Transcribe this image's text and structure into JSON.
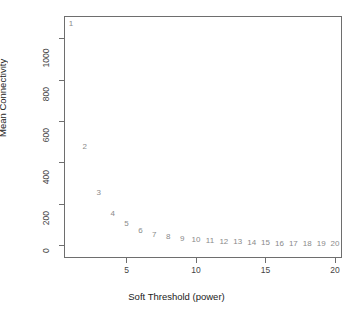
{
  "chart_data": {
    "type": "scatter",
    "title": "",
    "xlabel": "Soft Threshold (power)",
    "ylabel": "Mean Connectivity",
    "xlim": [
      0.5,
      20.5
    ],
    "ylim": [
      -60,
      1110
    ],
    "grid": false,
    "legend": null,
    "point_marker_style": "numeric-text-label",
    "x": [
      1,
      2,
      3,
      4,
      5,
      6,
      7,
      8,
      9,
      10,
      11,
      12,
      13,
      14,
      15,
      16,
      17,
      18,
      19,
      20
    ],
    "values": [
      1070,
      477,
      254,
      153,
      102,
      72,
      53,
      41,
      32,
      26,
      21,
      18,
      15,
      13,
      11,
      10,
      9,
      8,
      7,
      6
    ],
    "point_labels": [
      "1",
      "2",
      "3",
      "4",
      "5",
      "6",
      "7",
      "8",
      "9",
      "10",
      "11",
      "12",
      "13",
      "14",
      "15",
      "16",
      "17",
      "18",
      "19",
      "20"
    ],
    "xticks": [
      5,
      10,
      15,
      20
    ],
    "xtick_labels": [
      "5",
      "10",
      "15",
      "20"
    ],
    "yticks": [
      0,
      200,
      400,
      600,
      800,
      1000
    ],
    "ytick_labels": [
      "0",
      "200",
      "400",
      "600",
      "800",
      "1000"
    ],
    "colors": {
      "point_label": "#8a8a8a",
      "axis": "#6e6e6e",
      "tick_label": "#444444",
      "axis_title": "#222222",
      "background": "#ffffff"
    }
  }
}
